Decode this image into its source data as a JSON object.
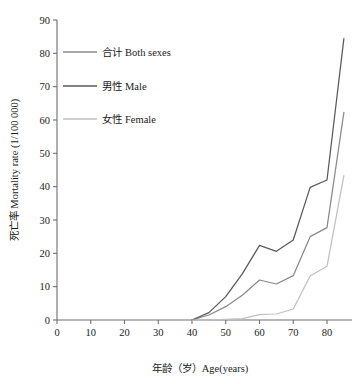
{
  "chart_data": {
    "type": "line",
    "title": "",
    "xlabel": "年龄（岁）Age(years)",
    "ylabel": "死亡率 Mortality rate (1/100 000)",
    "xlim": [
      0,
      86
    ],
    "ylim": [
      0,
      90
    ],
    "xticks": [
      0,
      10,
      20,
      30,
      40,
      50,
      60,
      70,
      80
    ],
    "yticks": [
      0,
      10,
      20,
      30,
      40,
      50,
      60,
      70,
      80,
      90
    ],
    "grid": false,
    "legend_position": "upper-left-inside",
    "x": [
      40,
      45,
      50,
      55,
      60,
      65,
      70,
      75,
      80,
      85
    ],
    "series": [
      {
        "name": "合计 Both sexes",
        "label_cjk": "合计",
        "label_en": "Both sexes",
        "color": "#8a8a8a",
        "values": [
          0.0,
          1.5,
          4.0,
          7.5,
          12.0,
          10.8,
          13.3,
          25.0,
          27.7,
          62.3
        ]
      },
      {
        "name": "男性 Male",
        "label_cjk": "男性",
        "label_en": "Male",
        "color": "#5a5a5a",
        "values": [
          0.0,
          2.2,
          7.0,
          14.0,
          22.4,
          20.6,
          24.0,
          39.8,
          42.0,
          84.4
        ]
      },
      {
        "name": "女性 Female",
        "label_cjk": "女性",
        "label_en": "Female",
        "color": "#c0c0c0",
        "values": [
          0.0,
          0.0,
          0.2,
          0.4,
          1.6,
          1.8,
          3.3,
          13.2,
          16.1,
          43.3
        ]
      }
    ]
  },
  "axes": {
    "x_tick_labels": [
      "0",
      "10",
      "20",
      "30",
      "40",
      "50",
      "60",
      "70",
      "80"
    ],
    "y_tick_labels": [
      "0",
      "10",
      "20",
      "30",
      "40",
      "50",
      "60",
      "70",
      "80",
      "90"
    ],
    "x_axis_title": "年龄（岁）Age(years)",
    "y_axis_title": "死亡率 Mortality rate (1/100 000)"
  },
  "legend": {
    "items": [
      {
        "label": "合计 Both sexes",
        "color": "#8a8a8a"
      },
      {
        "label": "男性 Male",
        "color": "#5a5a5a"
      },
      {
        "label": "女性 Female",
        "color": "#c0c0c0"
      }
    ]
  }
}
